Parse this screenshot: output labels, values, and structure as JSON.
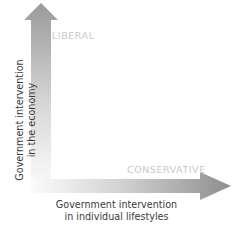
{
  "diagram": {
    "type": "two-axis-arrow-diagram",
    "background_color": "#ffffff"
  },
  "axes": {
    "vertical": {
      "name": "economy-axis",
      "direction": "up",
      "caption_line1": "Government intervention",
      "caption_line2": "in the economy",
      "gradient_from": "#9c9c9c",
      "gradient_to": "#f5f5f5",
      "orientation": "rotated-90-ccw"
    },
    "horizontal": {
      "name": "lifestyles-axis",
      "direction": "right",
      "caption_line1": "Government intervention",
      "caption_line2": "in individual lifestyles",
      "gradient_from": "#f5f5f5",
      "gradient_to": "#8f8f8f"
    }
  },
  "labels": {
    "liberal": "LIBERAL",
    "conservative": "CONSERVATIVE",
    "label_color": "#c9c9c9",
    "caption_color": "#3b3b3b"
  }
}
